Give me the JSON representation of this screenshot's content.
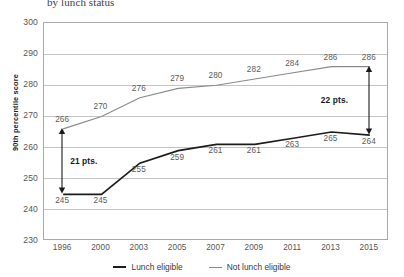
{
  "title": "by lunch status",
  "legend": {
    "items": [
      {
        "label": "Lunch eligible",
        "color": "#1c1c1c"
      },
      {
        "label": "Not lunch eligible",
        "color": "#8a8a8a"
      }
    ]
  },
  "annotations": [
    {
      "name": "gap-1996",
      "label": "21 pts.",
      "year": "1996",
      "from": 245,
      "to": 266
    },
    {
      "name": "gap-2015",
      "label": "22 pts.",
      "year": "2015",
      "from": 264,
      "to": 286
    }
  ],
  "chart_data": {
    "type": "line",
    "title": "by lunch status",
    "xlabel": "",
    "ylabel": "90th percentile score",
    "categories": [
      "1996",
      "2000",
      "2003",
      "2005",
      "2007",
      "2009",
      "2011",
      "2013",
      "2015"
    ],
    "ylim": [
      230,
      300
    ],
    "yticks": [
      230,
      240,
      250,
      260,
      270,
      280,
      290,
      300
    ],
    "grid": true,
    "legend_position": "bottom",
    "series": [
      {
        "name": "Lunch eligible",
        "color": "#1c1c1c",
        "values": [
          245,
          245,
          255,
          259,
          261,
          261,
          263,
          265,
          264
        ],
        "label_position": "below"
      },
      {
        "name": "Not lunch eligible",
        "color": "#8a8a8a",
        "values": [
          266,
          270,
          276,
          279,
          280,
          282,
          284,
          286,
          286
        ],
        "label_position": "above"
      }
    ]
  }
}
